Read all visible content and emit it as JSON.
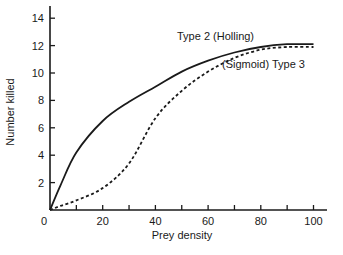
{
  "chart_data": {
    "type": "line",
    "title": "",
    "xlabel": "Prey density",
    "ylabel": "Number killed",
    "xlim": [
      0,
      100
    ],
    "ylim": [
      0,
      15
    ],
    "xticks": [
      0,
      10,
      20,
      30,
      40,
      50,
      60,
      70,
      80,
      90,
      100
    ],
    "xtick_labels": [
      "0",
      "20",
      "40",
      "60",
      "80",
      "100"
    ],
    "xtick_label_values": [
      0,
      20,
      40,
      60,
      80,
      100
    ],
    "yticks": [
      2,
      4,
      6,
      8,
      10,
      12,
      14
    ],
    "ytick_labels": [
      "2",
      "4",
      "6",
      "8",
      "10",
      "12",
      "14"
    ],
    "grid": false,
    "legend": "inline annotations",
    "x": [
      0,
      4,
      10,
      20,
      30,
      40,
      50,
      60,
      70,
      80,
      90,
      100
    ],
    "series": [
      {
        "name": "Type 2 (Holling)",
        "label": "Type 2  (Holling)",
        "style": "solid",
        "color": "#1a1a1a",
        "values": [
          0,
          1.8,
          4.2,
          6.5,
          7.9,
          9.0,
          10.1,
          10.9,
          11.5,
          11.9,
          12.1,
          12.1
        ]
      },
      {
        "name": "(Sigmoid) Type 3",
        "label": "(Sigmoid)  Type 3",
        "style": "dashed",
        "color": "#1a1a1a",
        "values": [
          0,
          0.3,
          0.7,
          1.6,
          3.4,
          6.7,
          8.7,
          10.1,
          11.1,
          11.7,
          11.9,
          11.9
        ]
      }
    ],
    "annotations": [
      {
        "text": "Type 2  (Holling)",
        "x_px": 177,
        "y_px": 40
      },
      {
        "text": "(Sigmoid)  Type 3",
        "x_px": 222,
        "y_px": 68
      }
    ]
  }
}
